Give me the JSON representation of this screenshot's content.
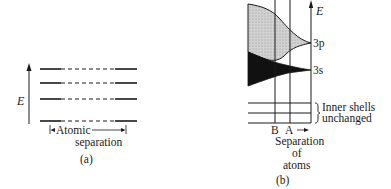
{
  "panel_a": {
    "axis_label": "E",
    "separation_label_line1": "Atomic",
    "separation_label_line2": "separation",
    "caption": "(a)",
    "levels_y": [
      69,
      83,
      99,
      121
    ]
  },
  "panel_b": {
    "axis_label": "E",
    "band_3p_label": "3p",
    "band_3s_label": "3s",
    "marker_b": "B",
    "marker_a": "A",
    "inner_shells_line1": "Inner shells",
    "inner_shells_line2": "unchanged",
    "separation_line1": "Separation",
    "separation_line2": "of",
    "separation_line3": "atoms",
    "caption": "(b)",
    "colors": {
      "band_3p_fill": "#c9c9c9",
      "band_3s_fill": "#111111",
      "line": "#1a1a1a"
    }
  }
}
